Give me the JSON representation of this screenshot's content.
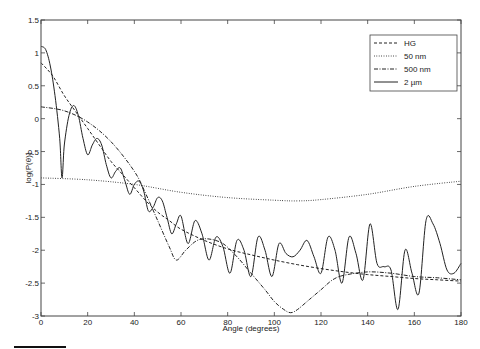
{
  "chart_data": {
    "type": "line",
    "title": "",
    "xlabel": "Angle (degrees)",
    "ylabel": "log(P(θ))",
    "xlim": [
      0,
      180
    ],
    "ylim": [
      -3,
      1.5
    ],
    "xticks": [
      "0",
      "20",
      "40",
      "60",
      "80",
      "100",
      "120",
      "140",
      "160",
      "180"
    ],
    "yticks": [
      "1.5",
      "1",
      "0.5",
      "0",
      "-0.5",
      "-1",
      "-1.5",
      "-2",
      "-2.5",
      "-3"
    ],
    "grid": false,
    "legend_position": "upper right",
    "series": [
      {
        "name": "HG",
        "style": "dashed",
        "x": [
          0,
          5,
          10,
          15,
          20,
          25,
          30,
          35,
          40,
          45,
          50,
          55,
          60,
          70,
          80,
          90,
          100,
          110,
          120,
          130,
          140,
          150,
          160,
          170,
          180
        ],
        "y": [
          0.85,
          0.65,
          0.35,
          0.1,
          -0.15,
          -0.4,
          -0.65,
          -0.85,
          -1.05,
          -1.25,
          -1.42,
          -1.55,
          -1.68,
          -1.85,
          -1.98,
          -2.07,
          -2.15,
          -2.22,
          -2.28,
          -2.33,
          -2.37,
          -2.4,
          -2.43,
          -2.45,
          -2.47
        ]
      },
      {
        "name": "50 nm",
        "style": "dotted",
        "x": [
          0,
          20,
          40,
          60,
          80,
          100,
          110,
          120,
          140,
          160,
          180
        ],
        "y": [
          -0.9,
          -0.93,
          -1.0,
          -1.12,
          -1.2,
          -1.24,
          -1.25,
          -1.23,
          -1.15,
          -1.03,
          -0.95
        ]
      },
      {
        "name": "500 nm",
        "style": "dashdot",
        "x": [
          0,
          10,
          20,
          30,
          40,
          45,
          50,
          55,
          58,
          62,
          67,
          72,
          78,
          84,
          90,
          96,
          100,
          104,
          107,
          110,
          115,
          120,
          125,
          130,
          140,
          150,
          160,
          170,
          180
        ],
        "y": [
          0.18,
          0.12,
          -0.05,
          -0.35,
          -0.8,
          -1.15,
          -1.55,
          -1.95,
          -2.15,
          -2.0,
          -1.85,
          -1.83,
          -1.9,
          -2.1,
          -2.35,
          -2.6,
          -2.78,
          -2.9,
          -2.95,
          -2.9,
          -2.75,
          -2.6,
          -2.45,
          -2.38,
          -2.33,
          -2.35,
          -2.4,
          -2.42,
          -2.45
        ]
      },
      {
        "name": "2 µm",
        "style": "solid",
        "x": [
          0,
          2,
          4,
          6,
          8,
          9,
          10,
          12,
          14,
          16,
          18,
          20,
          22,
          24,
          26,
          28,
          30,
          32,
          34,
          36,
          38,
          40,
          42,
          44,
          46,
          48,
          50,
          52,
          54,
          56,
          58,
          60,
          63,
          66,
          69,
          72,
          75,
          78,
          81,
          84,
          87,
          90,
          93,
          96,
          99,
          102,
          105,
          108,
          111,
          114,
          117,
          120,
          123,
          126,
          129,
          132,
          135,
          138,
          141,
          144,
          147,
          150,
          153,
          156,
          159,
          162,
          165,
          168,
          171,
          174,
          177,
          180
        ],
        "y": [
          1.1,
          1.05,
          0.8,
          0.35,
          -0.3,
          -0.9,
          -0.4,
          0.05,
          0.2,
          0.05,
          -0.3,
          -0.55,
          -0.4,
          -0.3,
          -0.4,
          -0.7,
          -0.9,
          -0.8,
          -0.75,
          -0.95,
          -1.15,
          -1.0,
          -0.95,
          -1.1,
          -1.4,
          -1.35,
          -1.2,
          -1.25,
          -1.5,
          -1.75,
          -1.6,
          -1.48,
          -1.9,
          -1.55,
          -1.75,
          -2.15,
          -1.8,
          -1.95,
          -2.35,
          -1.85,
          -2.0,
          -2.4,
          -1.8,
          -2.0,
          -2.4,
          -1.9,
          -2.05,
          -2.1,
          -2.0,
          -1.85,
          -2.1,
          -2.35,
          -1.8,
          -2.0,
          -2.5,
          -1.8,
          -2.05,
          -2.45,
          -1.6,
          -2.2,
          -2.25,
          -2.3,
          -2.9,
          -2.0,
          -2.35,
          -2.65,
          -1.55,
          -1.6,
          -1.9,
          -2.3,
          -2.35,
          -2.2
        ]
      }
    ]
  },
  "axes": {
    "ylabel": "log(P(θ))",
    "xlabel": "Angle (degrees)"
  },
  "legend": {
    "items": [
      "HG",
      "50 nm",
      "500 nm",
      "2 µm"
    ]
  }
}
